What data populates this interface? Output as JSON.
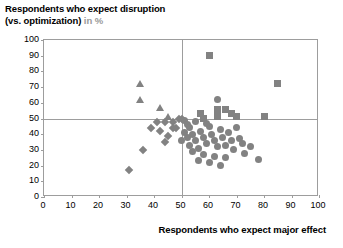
{
  "title": {
    "line1": "Respondents who expect disruption",
    "line2_bold": "(vs. optimization)",
    "line2_muted": "in %"
  },
  "chart_data": {
    "type": "scatter",
    "title": "Respondents who expect disruption (vs. optimization) in %",
    "xlabel": "Respondents who expect major effect",
    "ylabel": "Respondents who expect disruption (vs. optimization) in %",
    "xlim": [
      0,
      100
    ],
    "ylim": [
      0,
      100
    ],
    "xticks": [
      0,
      10,
      20,
      30,
      40,
      50,
      60,
      70,
      80,
      90,
      100
    ],
    "yticks": [
      0,
      10,
      20,
      30,
      40,
      50,
      60,
      70,
      80,
      90,
      100
    ],
    "grid": false,
    "legend": "none",
    "reference_lines": {
      "horizontal": 50,
      "vertical": 50
    },
    "marker_color": "#828282",
    "series": [
      {
        "name": "triangles",
        "marker": "triangle",
        "points": [
          [
            35,
            72
          ],
          [
            35,
            62
          ],
          [
            42,
            57
          ],
          [
            45,
            51
          ]
        ]
      },
      {
        "name": "diamonds",
        "marker": "diamond",
        "points": [
          [
            41,
            48
          ],
          [
            44,
            48
          ],
          [
            47,
            48
          ],
          [
            47,
            44
          ],
          [
            31,
            17
          ],
          [
            36,
            30
          ],
          [
            39,
            44
          ],
          [
            42,
            42
          ],
          [
            45,
            39
          ],
          [
            44,
            35
          ],
          [
            48,
            44
          ],
          [
            49,
            50
          ],
          [
            50,
            50
          ]
        ]
      },
      {
        "name": "squares",
        "marker": "square",
        "points": [
          [
            60,
            90
          ],
          [
            57,
            53
          ],
          [
            63,
            56
          ],
          [
            63,
            51
          ],
          [
            58,
            50
          ],
          [
            66,
            56
          ],
          [
            68,
            53
          ],
          [
            70,
            51
          ],
          [
            80,
            51
          ],
          [
            85,
            72
          ]
        ]
      },
      {
        "name": "circles",
        "marker": "circle",
        "points": [
          [
            51,
            49
          ],
          [
            52,
            46
          ],
          [
            53,
            44
          ],
          [
            51,
            41
          ],
          [
            52,
            38
          ],
          [
            54,
            40
          ],
          [
            55,
            36
          ],
          [
            53,
            33
          ],
          [
            56,
            31
          ],
          [
            57,
            42
          ],
          [
            58,
            38
          ],
          [
            59,
            34
          ],
          [
            60,
            45
          ],
          [
            61,
            40
          ],
          [
            62,
            36
          ],
          [
            63,
            32
          ],
          [
            64,
            43
          ],
          [
            65,
            38
          ],
          [
            66,
            33
          ],
          [
            67,
            41
          ],
          [
            68,
            36
          ],
          [
            69,
            30
          ],
          [
            70,
            44
          ],
          [
            71,
            37
          ],
          [
            72,
            34
          ],
          [
            73,
            28
          ],
          [
            58,
            27
          ],
          [
            62,
            26
          ],
          [
            66,
            25
          ],
          [
            60,
            22
          ],
          [
            64,
            20
          ],
          [
            56,
            23
          ],
          [
            78,
            24
          ],
          [
            75,
            32
          ],
          [
            54,
            29
          ],
          [
            50,
            36
          ],
          [
            55,
            48
          ],
          [
            59,
            47
          ],
          [
            63,
            62
          ]
        ]
      }
    ]
  },
  "x_axis": {
    "title": "Respondents who expect major effect",
    "ticks": [
      "0",
      "10",
      "20",
      "30",
      "40",
      "50",
      "60",
      "70",
      "80",
      "90",
      "100"
    ]
  },
  "y_axis": {
    "ticks": [
      "0",
      "10",
      "20",
      "30",
      "40",
      "50",
      "60",
      "70",
      "80",
      "90",
      "100"
    ]
  }
}
